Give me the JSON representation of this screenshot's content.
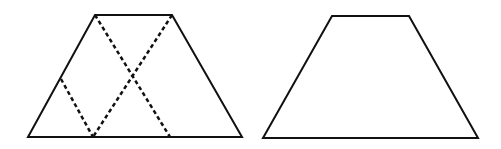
{
  "figure": {
    "stroke_color": "#111111",
    "background": "#ffffff",
    "left_trapezoid": {
      "vertices": [
        [
          95,
          15
        ],
        [
          172,
          15
        ],
        [
          242,
          137
        ],
        [
          28,
          137
        ]
      ],
      "dashed_lines": [
        {
          "from": [
            95,
            15
          ],
          "to": [
            170,
            137
          ]
        },
        {
          "from": [
            172,
            15
          ],
          "to": [
            93,
            137
          ]
        },
        {
          "from": [
            61,
            79
          ],
          "to": [
            93,
            137
          ]
        }
      ]
    },
    "right_trapezoid": {
      "vertices": [
        [
          332,
          16
        ],
        [
          409,
          16
        ],
        [
          478,
          138
        ],
        [
          263,
          138
        ]
      ]
    }
  }
}
